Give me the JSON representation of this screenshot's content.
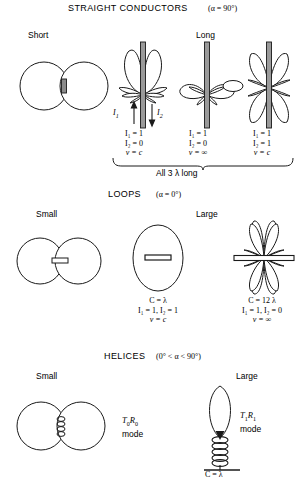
{
  "figure": {
    "sections": [
      {
        "id": "straight-conductors",
        "title": "STRAIGHT CONDUCTORS",
        "angle": "(α = 90°)",
        "left_label": "Short",
        "right_label": "Long",
        "bracket_label": "All 3 λ long",
        "current_labels": {
          "i1": "I",
          "i1sub": "1",
          "i2": "I",
          "i2sub": "2"
        },
        "cases": [
          {
            "i1": "I₁ = 1",
            "i2": "I₂ = 0",
            "v": "v = c"
          },
          {
            "i1": "I₁ = 1",
            "i2": "I₂ = 0",
            "v": "v = ∞"
          },
          {
            "i1": "I₁ = 1",
            "i2": "I₂ = 1",
            "v": "v = c"
          }
        ]
      },
      {
        "id": "loops",
        "title": "LOOPS",
        "angle": "(α = 0°)",
        "left_label": "Small",
        "right_label": "Large",
        "cases": [
          {
            "c": "C = λ",
            "i": "I₁ = 1, I₂ = 1",
            "v": "v = c"
          },
          {
            "c": "C = 12 λ",
            "i": "I₁ = 1, I₂ = 0",
            "v": "v = ∞"
          }
        ]
      },
      {
        "id": "helices",
        "title": "HELICES",
        "angle": "(0° < α < 90°)",
        "left_label": "Small",
        "right_label": "Large",
        "modes": [
          {
            "name": "T₀R₀",
            "word": "mode"
          },
          {
            "name": "T₁R₁",
            "word": "mode"
          }
        ],
        "helix_circumference": "C = λ"
      }
    ],
    "colors": {
      "stroke": "#1a1a1a",
      "fill": "#ffffff",
      "conductor": "#5a5a5a"
    }
  }
}
